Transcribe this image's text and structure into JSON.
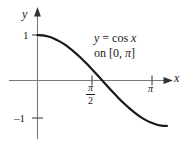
{
  "figure": {
    "axes": {
      "y_axis_label": "y",
      "x_axis_label": "x"
    },
    "tick_labels": {
      "y_positive_one": "1",
      "y_negative_one": "–1",
      "x_half_pi_numerator": "π",
      "x_half_pi_denominator": "2",
      "x_pi": "π"
    },
    "annotation": {
      "line1_lhs": "y",
      "line1_mid": " = cos ",
      "line1_rhs": "x",
      "line2_prefix": "on [0, ",
      "line2_pi": "π",
      "line2_suffix": "]"
    },
    "colors": {
      "curve": "#1a1a1a",
      "axis": "#7a7a7a",
      "text": "#1a1a1a",
      "background": "#ffffff"
    }
  },
  "chart_data": {
    "type": "line",
    "title": "",
    "subtitle": "",
    "annotation_text": "y = cos x on [0, π]",
    "function": "y = cos(x)",
    "domain_label": "[0, π]",
    "xlabel": "x",
    "ylabel": "y",
    "xlim": [
      0,
      3.4557519
    ],
    "ylim": [
      -1.45,
      1.45
    ],
    "grid": false,
    "legend": false,
    "legend_position": "none",
    "x_ticks": [
      1.5707963,
      3.1415927
    ],
    "x_tick_labels": [
      "π/2",
      "π"
    ],
    "y_ticks": [
      1,
      -1
    ],
    "y_tick_labels": [
      "1",
      "–1"
    ],
    "axis_arrows": [
      "x-positive",
      "y-positive"
    ],
    "x": [
      0,
      0.1308997,
      0.2617994,
      0.3926991,
      0.5235988,
      0.6544985,
      0.7853982,
      0.9162979,
      1.0471976,
      1.1780972,
      1.3089969,
      1.4398966,
      1.5707963,
      1.701696,
      1.8325957,
      1.9634954,
      2.0943951,
      2.2252948,
      2.3561945,
      2.4870942,
      2.6179939,
      2.7488936,
      2.8797933,
      3.010693,
      3.1415927
    ],
    "y": [
      1.0,
      0.9914449,
      0.9659258,
      0.9238795,
      0.8660254,
      0.7933533,
      0.7071068,
      0.6087614,
      0.5,
      0.3826834,
      0.258819,
      0.1305262,
      0.0,
      -0.1305262,
      -0.258819,
      -0.3826834,
      -0.5,
      -0.6087614,
      -0.7071068,
      -0.7933533,
      -0.8660254,
      -0.9238795,
      -0.9659258,
      -0.9914449,
      -1.0
    ],
    "series": [
      {
        "name": "y = cos x",
        "x": [
          0,
          0.1308997,
          0.2617994,
          0.3926991,
          0.5235988,
          0.6544985,
          0.7853982,
          0.9162979,
          1.0471976,
          1.1780972,
          1.3089969,
          1.4398966,
          1.5707963,
          1.701696,
          1.8325957,
          1.9634954,
          2.0943951,
          2.2252948,
          2.3561945,
          2.4870942,
          2.6179939,
          2.7488936,
          2.8797933,
          3.010693,
          3.1415927
        ],
        "values": [
          1.0,
          0.9914449,
          0.9659258,
          0.9238795,
          0.8660254,
          0.7933533,
          0.7071068,
          0.6087614,
          0.5,
          0.3826834,
          0.258819,
          0.1305262,
          0.0,
          -0.1305262,
          -0.258819,
          -0.3826834,
          -0.5,
          -0.6087614,
          -0.7071068,
          -0.7933533,
          -0.8660254,
          -0.9238795,
          -0.9659258,
          -0.9914449,
          -1.0
        ],
        "color": "#1a1a1a"
      }
    ],
    "key_points": [
      {
        "x": 0,
        "y": 1,
        "note": "start at (0, 1)"
      },
      {
        "x": 1.5707963,
        "y": 0,
        "note": "x-intercept at π/2"
      },
      {
        "x": 3.1415927,
        "y": -1,
        "note": "end at (π, –1)"
      }
    ]
  }
}
